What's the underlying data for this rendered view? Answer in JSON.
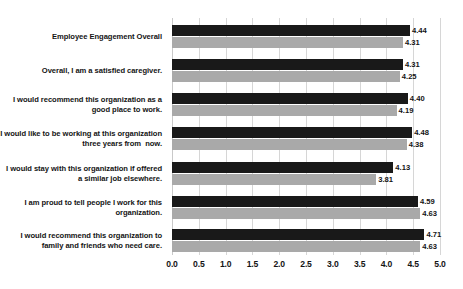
{
  "chart_data": {
    "type": "bar",
    "orientation": "horizontal",
    "title": "",
    "xlabel": "",
    "ylabel": "",
    "xlim": [
      0.0,
      5.0
    ],
    "xticks": [
      "0.0",
      "0.5",
      "1.0",
      "1.5",
      "2.0",
      "2.5",
      "3.0",
      "3.5",
      "4.0",
      "4.5",
      "5.0"
    ],
    "xtick_values": [
      0.0,
      0.5,
      1.0,
      1.5,
      2.0,
      2.5,
      3.0,
      3.5,
      4.0,
      4.5,
      5.0
    ],
    "grid": true,
    "legend": "none",
    "categories": [
      "Employee Engagement Overall",
      "Overall, I am a satisfied caregiver.",
      "I would recommend this organization as a good place to work.",
      "I would like to be working at this organization three years from  now.",
      "I would stay with this organization if offered a similar job elsewhere.",
      "I am proud to tell people I work for this organization.",
      "I would recommend this organization to family and friends who need care."
    ],
    "series": [
      {
        "name": "series-dark",
        "color": "#191919",
        "values": [
          4.44,
          4.31,
          4.4,
          4.48,
          4.13,
          4.59,
          4.71
        ],
        "labels": [
          "4.44",
          "4.31",
          "4.40",
          "4.48",
          "4.13",
          "4.59",
          "4.71"
        ]
      },
      {
        "name": "series-gray",
        "color": "#a9a9a9",
        "values": [
          4.31,
          4.25,
          4.19,
          4.38,
          3.81,
          4.63,
          4.63
        ],
        "labels": [
          "4.31",
          "4.25",
          "4.19",
          "4.38",
          "3.81",
          "4.63",
          "4.63"
        ]
      }
    ]
  },
  "colors": {
    "series_dark": "#191919",
    "series_gray": "#a9a9a9",
    "gridline": "#d6d6d6",
    "text": "#141414",
    "background": "#ffffff"
  }
}
